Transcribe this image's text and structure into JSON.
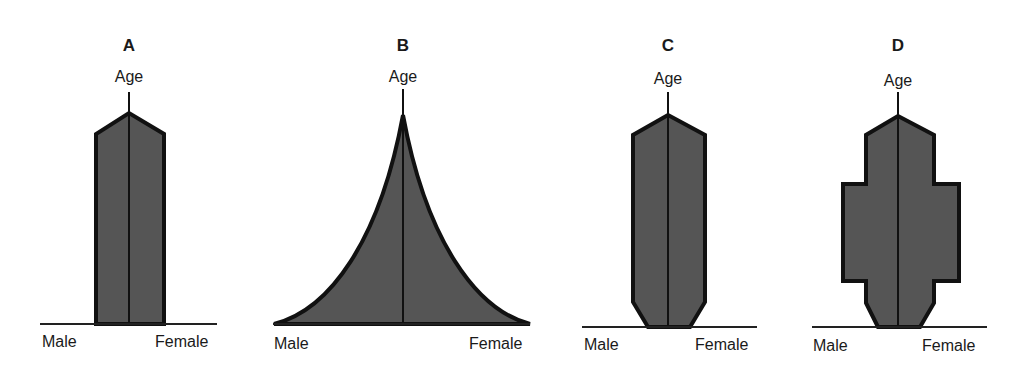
{
  "figure": {
    "colors": {
      "fill": "#555555",
      "outline": "#111111",
      "background": "#ffffff"
    },
    "panels": [
      {
        "id": "A",
        "label": "A",
        "y_axis_label": "Age",
        "left_label": "Male",
        "right_label": "Female",
        "shape": "column with pointed top (stationary population)"
      },
      {
        "id": "B",
        "label": "B",
        "y_axis_label": "Age",
        "left_label": "Male",
        "right_label": "Female",
        "shape": "concave triangular pyramid (expanding population)"
      },
      {
        "id": "C",
        "label": "C",
        "y_axis_label": "Age",
        "left_label": "Male",
        "right_label": "Female",
        "shape": "column with pointed top and narrowed base (contracting population)"
      },
      {
        "id": "D",
        "label": "D",
        "y_axis_label": "Age",
        "left_label": "Male",
        "right_label": "Female",
        "shape": "column with middle-age bulge and narrowed base"
      }
    ]
  }
}
